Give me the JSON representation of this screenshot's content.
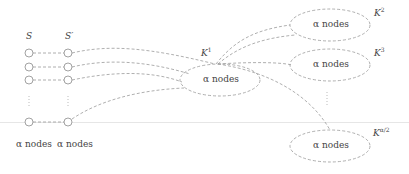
{
  "diagram": {
    "left_column": {
      "label": "S",
      "bottom_label": "α nodes",
      "x": 29,
      "node_ys": [
        53,
        67,
        80,
        122
      ]
    },
    "right_column": {
      "label": "S",
      "label_prime": "′",
      "bottom_label": "α nodes",
      "x": 68,
      "node_ys": [
        53,
        67,
        80,
        122
      ]
    },
    "vdots": "⋮",
    "clusters": [
      {
        "id": "K1",
        "base": "K",
        "sup": "1",
        "text": "α nodes",
        "cx": 220,
        "cy": 80,
        "rx": 40,
        "ry": 16,
        "label_x": 200,
        "label_y": 44
      },
      {
        "id": "K2",
        "base": "K",
        "sup": "2",
        "text": "α nodes",
        "cx": 330,
        "cy": 25,
        "rx": 40,
        "ry": 16,
        "label_x": 373,
        "label_y": 4
      },
      {
        "id": "K3",
        "base": "K",
        "sup": "3",
        "text": "α nodes",
        "cx": 330,
        "cy": 65,
        "rx": 40,
        "ry": 16,
        "label_x": 373,
        "label_y": 44
      },
      {
        "id": "Kalpha2",
        "base": "K",
        "sup": "α/2",
        "text": "α nodes",
        "cx": 330,
        "cy": 146,
        "rx": 40,
        "ry": 16,
        "label_x": 373,
        "label_y": 124
      }
    ],
    "colors": {
      "edge": "#9a9a9a",
      "node": "#8a8a8a",
      "text": "#444444",
      "guide_line": "#e6e6e6"
    }
  }
}
